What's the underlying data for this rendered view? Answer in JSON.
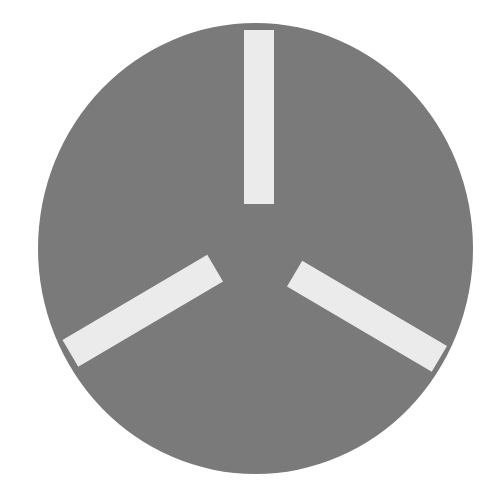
{
  "figure": {
    "background_color": "#ffffff",
    "disc": {
      "cx": 255.5,
      "cy": 248.5,
      "rx": 217.5,
      "ry": 225.5,
      "color": "#7a7a7a"
    },
    "bars": [
      {
        "name": "top-bar",
        "cx": 259,
        "cy": 117,
        "length": 174,
        "width": 30,
        "angle_deg": 90,
        "color": "#ebebeb"
      },
      {
        "name": "lower-left-bar",
        "cx": 142.75,
        "cy": 310.75,
        "length": 168,
        "width": 31,
        "angle_deg": -30.5,
        "color": "#ebebeb"
      },
      {
        "name": "lower-right-bar",
        "cx": 367,
        "cy": 316.25,
        "length": 168,
        "width": 30,
        "angle_deg": 30.5,
        "color": "#ebebeb"
      }
    ]
  }
}
